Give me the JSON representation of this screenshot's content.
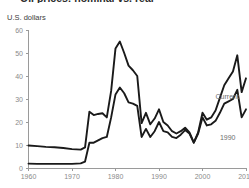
{
  "header": {
    "title": "Oil prices: nominal vs. real",
    "axis_unit_label": "U.S. dollars"
  },
  "chart_data": {
    "type": "line",
    "title": "Oil prices: nominal vs. real",
    "xlabel": "",
    "ylabel": "U.S. dollars",
    "xlim": [
      1960,
      2010
    ],
    "ylim": [
      0,
      60
    ],
    "grid": false,
    "legend_position": "inline-right",
    "yticks": [
      0,
      10,
      20,
      30,
      40,
      50,
      60
    ],
    "xticks": [
      1960,
      1970,
      1980,
      1990,
      2000,
      2010
    ],
    "annotations": [
      {
        "text": "Current",
        "x": 2003,
        "y": 31
      },
      {
        "text": "1990",
        "x": 2004,
        "y": 13
      }
    ],
    "series": [
      {
        "name": "1990",
        "label": "1990",
        "color": "#1a1a1a",
        "x": [
          1960,
          1962,
          1964,
          1966,
          1968,
          1970,
          1972,
          1973,
          1974,
          1975,
          1976,
          1977,
          1978,
          1979,
          1980,
          1981,
          1982,
          1983,
          1984,
          1985,
          1986,
          1987,
          1988,
          1989,
          1990,
          1991,
          1992,
          1993,
          1994,
          1995,
          1996,
          1997,
          1998,
          1999,
          2000,
          2001,
          2002,
          2003,
          2004,
          2005,
          2006,
          2007,
          2008,
          2009,
          2010
        ],
        "values": [
          9.8,
          9.5,
          9.2,
          9.0,
          8.7,
          8.2,
          8.0,
          9.0,
          24.5,
          23.0,
          23.5,
          23.8,
          22.0,
          33.5,
          52.0,
          55.0,
          50.0,
          44.5,
          42.5,
          40.0,
          19.5,
          24.0,
          19.0,
          21.5,
          25.5,
          20.0,
          18.5,
          16.0,
          15.0,
          16.0,
          17.5,
          15.5,
          11.0,
          15.0,
          22.0,
          18.5,
          19.0,
          20.5,
          24.0,
          28.0,
          29.0,
          30.0,
          34.0,
          22.0,
          25.5
        ]
      },
      {
        "name": "Current",
        "label": "Current",
        "color": "#1a1a1a",
        "x": [
          1960,
          1962,
          1964,
          1966,
          1968,
          1970,
          1972,
          1973,
          1974,
          1975,
          1976,
          1977,
          1978,
          1979,
          1980,
          1981,
          1982,
          1983,
          1984,
          1985,
          1986,
          1987,
          1988,
          1989,
          1990,
          1991,
          1992,
          1993,
          1994,
          1995,
          1996,
          1997,
          1998,
          1999,
          2000,
          2001,
          2002,
          2003,
          2004,
          2005,
          2006,
          2007,
          2008,
          2009,
          2010
        ],
        "values": [
          1.9,
          1.8,
          1.8,
          1.8,
          1.8,
          1.8,
          2.0,
          2.8,
          11.0,
          11.0,
          12.0,
          13.0,
          13.5,
          22.0,
          32.0,
          35.0,
          32.5,
          28.5,
          28.0,
          27.0,
          13.5,
          17.0,
          13.5,
          16.0,
          20.0,
          16.0,
          15.5,
          13.5,
          13.0,
          14.5,
          16.5,
          15.0,
          11.0,
          15.5,
          24.0,
          21.0,
          22.0,
          25.0,
          30.5,
          36.0,
          39.0,
          42.0,
          49.0,
          33.0,
          39.0
        ]
      }
    ]
  },
  "icons": {
    "chart_type": "line-chart-icon"
  },
  "colors": {
    "axis": "#9a9a9a",
    "tick_text": "#8a8a8a",
    "line": "#1a1a1a",
    "background": "#ffffff"
  }
}
